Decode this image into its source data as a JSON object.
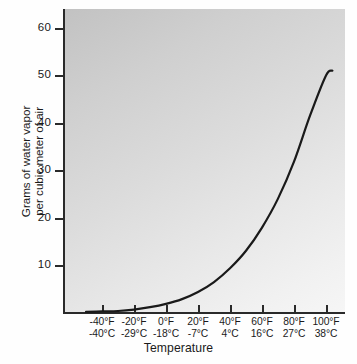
{
  "chart_data": {
    "type": "line",
    "title": "",
    "subtitle": "",
    "xlabel": "Temperature",
    "ylabel_line1": "Grams of water vapor",
    "ylabel_line2": "per cubic meter of air",
    "ylabel": "Grams of water vapor per cubic meter of air",
    "grid": false,
    "legend": "none",
    "xlim_f": [
      -50,
      110
    ],
    "ylim": [
      0,
      63
    ],
    "y_ticks": [
      10,
      20,
      30,
      40,
      50,
      60
    ],
    "y_tick_labels": [
      "10",
      "20",
      "30",
      "40",
      "50",
      "60"
    ],
    "x_ticks_f": [
      -40,
      -20,
      0,
      20,
      40,
      60,
      80,
      100
    ],
    "x_tick_labels_f": [
      "-40°F",
      "-20°F",
      "0°F",
      "20°F",
      "40°F",
      "60°F",
      "80°F",
      "100°F"
    ],
    "x_tick_labels_c": [
      "-40°C",
      "-29°C",
      "-18°C",
      "-7°C",
      "4°C",
      "16°C",
      "27°C",
      "38°C"
    ],
    "series": [
      {
        "name": "Saturation water vapor capacity",
        "x_f": [
          -50,
          -40,
          -30,
          -20,
          -10,
          0,
          10,
          20,
          30,
          40,
          50,
          60,
          70,
          80,
          90,
          100,
          104
        ],
        "x_c": [
          -45.6,
          -40,
          -34.4,
          -28.9,
          -23.3,
          -17.8,
          -12.2,
          -6.7,
          -1.1,
          4.4,
          10,
          15.6,
          21.1,
          26.7,
          32.2,
          37.8,
          40
        ],
        "values": [
          0.1,
          0.2,
          0.3,
          0.6,
          1.1,
          1.8,
          2.8,
          4.3,
          6.4,
          9.3,
          13.0,
          17.9,
          24.0,
          31.8,
          41.5,
          50.0,
          51.0
        ]
      }
    ],
    "curve_end_value": 51,
    "colors": {
      "curve": "#1a1a1a",
      "axis": "#2a2a2a",
      "panel_dark": "#c2c2c2",
      "panel_light": "#f6f6f6",
      "page_background": "#fefefe",
      "text": "#1a1a1a"
    }
  },
  "axes": {
    "y_ticks": [
      {
        "label": "60",
        "top": 28
      },
      {
        "label": "50",
        "top": 75
      },
      {
        "label": "40",
        "top": 123
      },
      {
        "label": "30",
        "top": 170
      },
      {
        "label": "20",
        "top": 218
      },
      {
        "label": "10",
        "top": 265
      }
    ],
    "x_ticks": [
      {
        "f": "-40°F",
        "c": "-40°C",
        "left": 102
      },
      {
        "f": "-20°F",
        "c": "-29°C",
        "left": 134
      },
      {
        "f": "0°F",
        "c": "-18°C",
        "left": 166
      },
      {
        "f": "20°F",
        "c": "-7°C",
        "left": 198
      },
      {
        "f": "40°F",
        "c": "4°C",
        "left": 230
      },
      {
        "f": "60°F",
        "c": "16°C",
        "left": 262
      },
      {
        "f": "80°F",
        "c": "27°C",
        "left": 294
      },
      {
        "f": "100°F",
        "c": "38°C",
        "left": 326
      }
    ]
  },
  "titles": {
    "x_axis": "Temperature",
    "y_axis_line1": "Grams of water vapor",
    "y_axis_line2": "per cubic meter of air"
  }
}
